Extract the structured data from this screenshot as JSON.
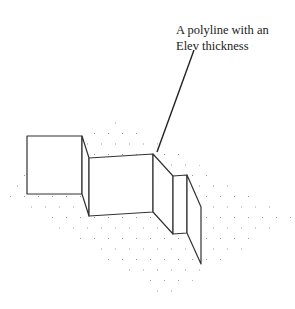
{
  "annotation": {
    "line1": "A polyline with an",
    "line2": "Elev thickness"
  },
  "colors": {
    "line": "#333333",
    "grid_dot": "#9a9a9a",
    "background": "#ffffff"
  }
}
